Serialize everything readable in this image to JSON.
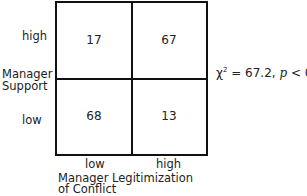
{
  "figure": {
    "y_axis": {
      "title_line1": "Manager",
      "title_line2": "Support",
      "ticks": [
        "high",
        "low"
      ]
    },
    "x_axis": {
      "title_line1": "Manager Legitimization",
      "title_line2": "of Conflict",
      "ticks": [
        "low",
        "high"
      ]
    },
    "cells": {
      "high_low": "17",
      "high_high": "67",
      "low_low": "68",
      "low_high": "13"
    },
    "statistic": {
      "chi": "χ",
      "sup": "2",
      "rest": " = 67.2, ",
      "p": "p",
      "tail": " < 0.01"
    }
  }
}
